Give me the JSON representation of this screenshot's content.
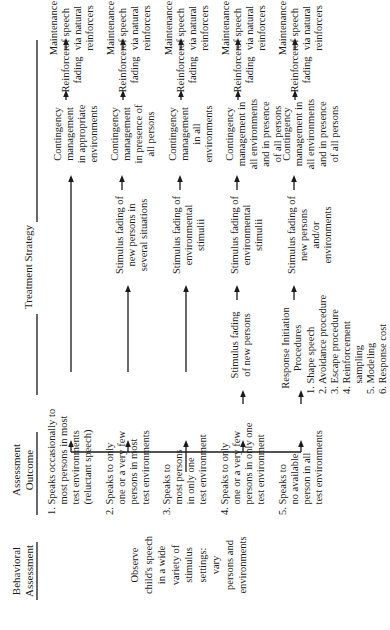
{
  "headers": {
    "behavioral": "Behavioral\nAssessment",
    "outcome": "Assessment\nOutcome",
    "treatment": "Treatment Strategy"
  },
  "behavioral_assessment": "Observe\nchild's speech\nin a wide\nvariety of\nstimulus\nsettings:\nvary\npersons and\nenvironments",
  "outcomes": [
    "1. Speaks occasionally to\n    most persons in most\n    test environments\n    (reluctant speech)",
    "2. Speaks to only\n    one or a very few\n    persons in most\n    test environments",
    "3. Speaks to\n    most persons\n    in only one\n    test environment",
    "4. Speaks to only\n    one or a very few\n    persons in only one\n    test environment",
    "5. Speaks to\n    no available\n    person in all\n    test environments"
  ],
  "response_initiation": {
    "title": "Response Initiation\nProcedures",
    "items": [
      "1. Shape speech",
      "2. Avoidance procedure",
      "3. Escape procedure",
      "4. Reinforcement\n    sampling",
      "5. Modeling",
      "6. Response cost"
    ]
  },
  "stimulus_fading": {
    "row2": "Stimulus fading of\nnew persons in\nseveral situations",
    "row3": "Stimulus fading of\nenvironmental\nstimulii",
    "row4a": "Stimulus fading\nof new persons",
    "row4b": "Stimulus fading of\nenvironmental\nstimulii",
    "row5": "Stimulus fading of\nnew persons\nand/or\nenvironments"
  },
  "contingency": [
    "Contingency\nmanagement\nin appropriate\nenvironments",
    "Contingency\nmanagement\nin presence of\nall persons",
    "Contingency\nmanagement\nin all\nenvironments",
    "Contingency\nmanagement in\nall environments\nand in presence\nof all persons",
    "Contingency\nmanagement in\nall environments\nand in presence\nof all persons"
  ],
  "reinforcer_fading": [
    "Reinforcer\nfading",
    "Reinforcer\nfading",
    "Reinforcer\nfading",
    "Reinforcer\nfading",
    "Reinforcer\nfading"
  ],
  "maintenance": [
    "Maintenance\nof speech\nvia natural\nreinforcers",
    "Maintenance\nof speech\nvia natural\nreinforcers",
    "Maintenance\nof speech\nvia natural\nreinforcers",
    "Maintenance\nof speech\nvia natural\nreinforcers",
    "Maintenance\nof speech\nvia natural\nreinforcers"
  ]
}
